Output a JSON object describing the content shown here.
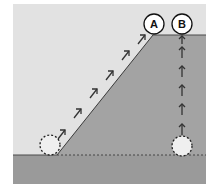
{
  "diagram": {
    "title": "",
    "colors": {
      "sky": "#e2e2e2",
      "ground": "#9e9e9e",
      "ground_edge": "#4a4a4a",
      "circle_fill": "#ffffff",
      "ghost_fill": "#efefef",
      "arrow": "#333333"
    },
    "labels": {
      "a": "A",
      "b": "B"
    },
    "paths": [
      {
        "id": "A",
        "description": "ball moves up the inclined slope",
        "start": "bottom-left dashed circle",
        "end": "circle A at top of slope",
        "arrow_count": 8
      },
      {
        "id": "B",
        "description": "ball moves straight up vertically",
        "start": "bottom-right dashed circle",
        "end": "circle B at plateau level",
        "arrow_count": 5
      }
    ]
  }
}
